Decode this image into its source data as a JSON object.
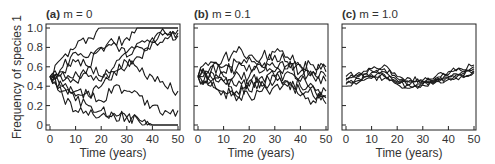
{
  "chart_data": [
    {
      "type": "line",
      "panel_label": "(a)",
      "title": "m = 0",
      "xlabel": "Time (years)",
      "ylabel": "Frequency of species 1",
      "xlim": [
        0,
        50
      ],
      "ylim": [
        0,
        1.0
      ],
      "x_ticks": [
        0,
        10,
        20,
        30,
        40,
        50
      ],
      "y_ticks": [
        0,
        0.2,
        0.4,
        0.6,
        0.8,
        1.0
      ],
      "y_tick_labels": [
        "0",
        "0.2",
        "0.4",
        "0.6",
        "0.8",
        "1.0"
      ],
      "grid": false,
      "x": [
        0,
        5,
        10,
        15,
        20,
        25,
        30,
        35,
        40,
        45,
        50
      ],
      "series": [
        {
          "name": "run 1",
          "values": [
            0.5,
            0.7,
            0.8,
            0.9,
            1.0,
            1.0,
            1.0,
            1.0,
            1.0,
            1.0,
            1.0
          ]
        },
        {
          "name": "run 2",
          "values": [
            0.5,
            0.6,
            0.75,
            0.7,
            0.8,
            0.85,
            0.9,
            1.0,
            1.0,
            1.0,
            1.0
          ]
        },
        {
          "name": "run 3",
          "values": [
            0.5,
            0.55,
            0.65,
            0.6,
            0.8,
            0.85,
            0.7,
            0.85,
            0.9,
            0.95,
            0.98
          ]
        },
        {
          "name": "run 4",
          "values": [
            0.5,
            0.45,
            0.55,
            0.5,
            0.45,
            0.6,
            0.75,
            0.8,
            0.85,
            0.9,
            0.95
          ]
        },
        {
          "name": "run 5",
          "values": [
            0.5,
            0.4,
            0.35,
            0.3,
            0.4,
            0.55,
            0.6,
            0.7,
            0.85,
            0.95,
            0.92
          ]
        },
        {
          "name": "run 6",
          "values": [
            0.5,
            0.55,
            0.45,
            0.6,
            0.5,
            0.55,
            0.65,
            0.55,
            0.5,
            0.4,
            0.35
          ]
        },
        {
          "name": "run 7",
          "values": [
            0.5,
            0.4,
            0.3,
            0.35,
            0.25,
            0.4,
            0.35,
            0.3,
            0.2,
            0.15,
            0.15
          ]
        },
        {
          "name": "run 8",
          "values": [
            0.5,
            0.35,
            0.25,
            0.2,
            0.15,
            0.1,
            0.08,
            0.05,
            0.0,
            0.0,
            0.0
          ]
        },
        {
          "name": "run 9",
          "values": [
            0.5,
            0.3,
            0.15,
            0.1,
            0.1,
            0.12,
            0.08,
            0.03,
            0.0,
            0.0,
            0.0
          ]
        }
      ]
    },
    {
      "type": "line",
      "panel_label": "(b)",
      "title": "m = 0.1",
      "xlabel": "Time (years)",
      "xlim": [
        0,
        50
      ],
      "ylim": [
        0,
        1.0
      ],
      "x_ticks": [
        0,
        10,
        20,
        30,
        40,
        50
      ],
      "grid": false,
      "x": [
        0,
        5,
        10,
        15,
        20,
        25,
        30,
        35,
        40,
        45,
        50
      ],
      "series": [
        {
          "name": "run 1",
          "values": [
            0.5,
            0.65,
            0.7,
            0.75,
            0.72,
            0.7,
            0.75,
            0.7,
            0.6,
            0.62,
            0.55
          ]
        },
        {
          "name": "run 2",
          "values": [
            0.5,
            0.6,
            0.55,
            0.65,
            0.7,
            0.6,
            0.72,
            0.65,
            0.55,
            0.5,
            0.45
          ]
        },
        {
          "name": "run 3",
          "values": [
            0.5,
            0.55,
            0.6,
            0.58,
            0.62,
            0.55,
            0.6,
            0.58,
            0.62,
            0.55,
            0.6
          ]
        },
        {
          "name": "run 4",
          "values": [
            0.5,
            0.5,
            0.45,
            0.55,
            0.5,
            0.6,
            0.55,
            0.62,
            0.5,
            0.55,
            0.5
          ]
        },
        {
          "name": "run 5",
          "values": [
            0.5,
            0.45,
            0.5,
            0.4,
            0.45,
            0.5,
            0.45,
            0.55,
            0.45,
            0.4,
            0.35
          ]
        },
        {
          "name": "run 6",
          "values": [
            0.5,
            0.4,
            0.35,
            0.3,
            0.35,
            0.4,
            0.5,
            0.45,
            0.4,
            0.3,
            0.28
          ]
        },
        {
          "name": "run 7",
          "values": [
            0.5,
            0.45,
            0.35,
            0.25,
            0.3,
            0.35,
            0.4,
            0.45,
            0.3,
            0.25,
            0.3
          ]
        },
        {
          "name": "run 8",
          "values": [
            0.5,
            0.55,
            0.45,
            0.35,
            0.4,
            0.45,
            0.5,
            0.4,
            0.35,
            0.4,
            0.22
          ]
        }
      ]
    },
    {
      "type": "line",
      "panel_label": "(c)",
      "title": "m = 1.0",
      "xlabel": "Time (years)",
      "xlim": [
        0,
        50
      ],
      "ylim": [
        0,
        1.0
      ],
      "x_ticks": [
        0,
        10,
        20,
        30,
        40,
        50
      ],
      "grid": false,
      "x": [
        0,
        5,
        10,
        15,
        20,
        25,
        30,
        35,
        40,
        45,
        50
      ],
      "series": [
        {
          "name": "run 1",
          "values": [
            0.5,
            0.54,
            0.58,
            0.62,
            0.5,
            0.48,
            0.46,
            0.5,
            0.55,
            0.58,
            0.62
          ]
        },
        {
          "name": "run 2",
          "values": [
            0.48,
            0.52,
            0.56,
            0.58,
            0.48,
            0.46,
            0.45,
            0.48,
            0.52,
            0.56,
            0.6
          ]
        },
        {
          "name": "run 3",
          "values": [
            0.46,
            0.5,
            0.54,
            0.55,
            0.46,
            0.44,
            0.44,
            0.47,
            0.5,
            0.54,
            0.58
          ]
        },
        {
          "name": "run 4",
          "values": [
            0.44,
            0.48,
            0.52,
            0.52,
            0.44,
            0.42,
            0.43,
            0.46,
            0.49,
            0.52,
            0.56
          ]
        },
        {
          "name": "run 5",
          "values": [
            0.42,
            0.46,
            0.5,
            0.5,
            0.43,
            0.4,
            0.42,
            0.45,
            0.48,
            0.51,
            0.55
          ]
        },
        {
          "name": "run 6",
          "values": [
            0.4,
            0.44,
            0.48,
            0.48,
            0.42,
            0.38,
            0.41,
            0.44,
            0.47,
            0.5,
            0.54
          ]
        }
      ]
    }
  ],
  "panels": [
    {
      "label": "(a)",
      "title": "m = 0",
      "xlabel": "Time (years)"
    },
    {
      "label": "(b)",
      "title": "m = 0.1",
      "xlabel": "Time (years)"
    },
    {
      "label": "(c)",
      "title": "m = 1.0",
      "xlabel": "Time (years)"
    }
  ],
  "ylabel": "Frequency of species 1",
  "x_tick_labels": [
    "0",
    "10",
    "20",
    "30",
    "40",
    "50"
  ],
  "y_tick_labels": [
    "0",
    "0.2",
    "0.4",
    "0.6",
    "0.8",
    "1.0"
  ]
}
